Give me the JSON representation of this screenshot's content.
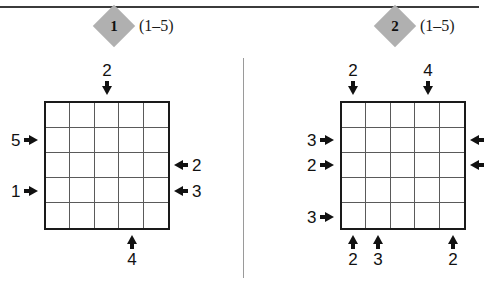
{
  "page": {
    "background": "#ffffff",
    "rule_color": "#3b3b3b",
    "divider_color": "#9a9a9a",
    "badge_color": "#b0b0b0",
    "grid_border_color": "#1a1a1a",
    "grid_line_color": "#5a5a5a"
  },
  "puzzles": [
    {
      "id": "puzzle-1",
      "badge_label": "1",
      "range_note": "(1–5)",
      "grid": {
        "rows": 5,
        "cols": 5
      },
      "clues": {
        "top": [
          {
            "col": 3,
            "value": "2"
          }
        ],
        "bottom": [
          {
            "col": 4,
            "value": "4"
          }
        ],
        "left": [
          {
            "row": 2,
            "value": "5"
          },
          {
            "row": 4,
            "value": "1"
          }
        ],
        "right": [
          {
            "row": 3,
            "value": "2"
          },
          {
            "row": 4,
            "value": "3"
          }
        ]
      }
    },
    {
      "id": "puzzle-2",
      "badge_label": "2",
      "range_note": "(1–5)",
      "grid": {
        "rows": 5,
        "cols": 5
      },
      "clues": {
        "top": [
          {
            "col": 1,
            "value": "2"
          },
          {
            "col": 4,
            "value": "4"
          }
        ],
        "bottom": [
          {
            "col": 1,
            "value": "2"
          },
          {
            "col": 2,
            "value": "3"
          },
          {
            "col": 5,
            "value": "2"
          }
        ],
        "left": [
          {
            "row": 2,
            "value": "3"
          },
          {
            "row": 3,
            "value": "2"
          },
          {
            "row": 5,
            "value": "3"
          }
        ],
        "right": [
          {
            "row": 2,
            "value": ""
          },
          {
            "row": 3,
            "value": ""
          }
        ]
      }
    }
  ]
}
